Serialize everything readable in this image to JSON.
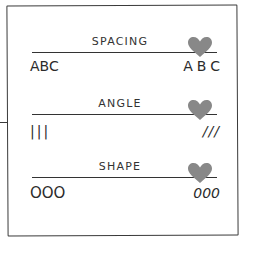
{
  "diagram": {
    "sections": [
      {
        "label": "SPACING",
        "left_sample": "ABC",
        "right_sample": "ABC",
        "marker_icon": "heart-icon"
      },
      {
        "label": "ANGLE",
        "left_sample": "|||",
        "right_sample": "///",
        "marker_icon": "heart-icon"
      },
      {
        "label": "SHAPE",
        "left_sample": "OOO",
        "right_sample": "000",
        "marker_icon": "heart-icon"
      }
    ],
    "colors": {
      "stroke": "#333333",
      "heart": "#888888",
      "background": "#ffffff"
    }
  }
}
